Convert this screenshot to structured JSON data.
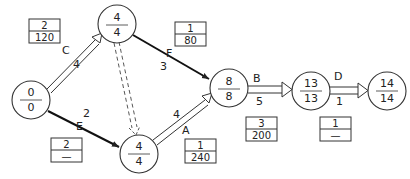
{
  "diagram": {
    "type": "activity-on-arrow network (critical path)",
    "nodes": [
      {
        "id": "n0",
        "top": "0",
        "bottom": "0",
        "cx": 31,
        "cy": 100
      },
      {
        "id": "n1",
        "top": "4",
        "bottom": "4",
        "cx": 117,
        "cy": 24
      },
      {
        "id": "n2",
        "top": "4",
        "bottom": "4",
        "cx": 139,
        "cy": 154
      },
      {
        "id": "n3",
        "top": "8",
        "bottom": "8",
        "cx": 229,
        "cy": 88
      },
      {
        "id": "n4",
        "top": "13",
        "bottom": "13",
        "cx": 311,
        "cy": 91
      },
      {
        "id": "n5",
        "top": "14",
        "bottom": "14",
        "cx": 387,
        "cy": 91
      }
    ],
    "activities": [
      {
        "name": "C",
        "duration": "4",
        "from": "n0",
        "to": "n1",
        "style": "double",
        "box": {
          "top": "2",
          "bottom": "120"
        }
      },
      {
        "name": "E",
        "duration": "2",
        "from": "n0",
        "to": "n2",
        "style": "solid",
        "box": {
          "top": "2",
          "bottom": "—"
        }
      },
      {
        "name": "F",
        "duration": "3",
        "from": "n1",
        "to": "n3",
        "style": "solid",
        "box": {
          "top": "1",
          "bottom": "80"
        }
      },
      {
        "name": "dummy",
        "duration": "",
        "from": "n1",
        "to": "n2",
        "style": "dashed-double"
      },
      {
        "name": "A",
        "duration": "4",
        "from": "n2",
        "to": "n3",
        "style": "double",
        "box": {
          "top": "1",
          "bottom": "240"
        }
      },
      {
        "name": "B",
        "duration": "5",
        "from": "n3",
        "to": "n4",
        "style": "double",
        "box": {
          "top": "3",
          "bottom": "200"
        }
      },
      {
        "name": "D",
        "duration": "1",
        "from": "n4",
        "to": "n5",
        "style": "double",
        "box": {
          "top": "1",
          "bottom": "—"
        }
      }
    ]
  },
  "labels": {
    "C": "C",
    "C_dur": "4",
    "E": "E",
    "E_dur": "2",
    "F": "F",
    "F_dur": "3",
    "A": "A",
    "A_dur": "4",
    "B": "B",
    "B_dur": "5",
    "D": "D",
    "D_dur": "1"
  },
  "boxes": {
    "c_box": {
      "top": "2",
      "bottom": "120"
    },
    "f_box": {
      "top": "1",
      "bottom": "80"
    },
    "e_box": {
      "top": "2",
      "bottom": "—"
    },
    "a_box": {
      "top": "1",
      "bottom": "240"
    },
    "b_box": {
      "top": "3",
      "bottom": "200"
    },
    "d_box": {
      "top": "1",
      "bottom": "—"
    }
  },
  "nodes": {
    "n0": {
      "top": "0",
      "bottom": "0"
    },
    "n1": {
      "top": "4",
      "bottom": "4"
    },
    "n2": {
      "top": "4",
      "bottom": "4"
    },
    "n3": {
      "top": "8",
      "bottom": "8"
    },
    "n4": {
      "top": "13",
      "bottom": "13"
    },
    "n5": {
      "top": "14",
      "bottom": "14"
    }
  }
}
